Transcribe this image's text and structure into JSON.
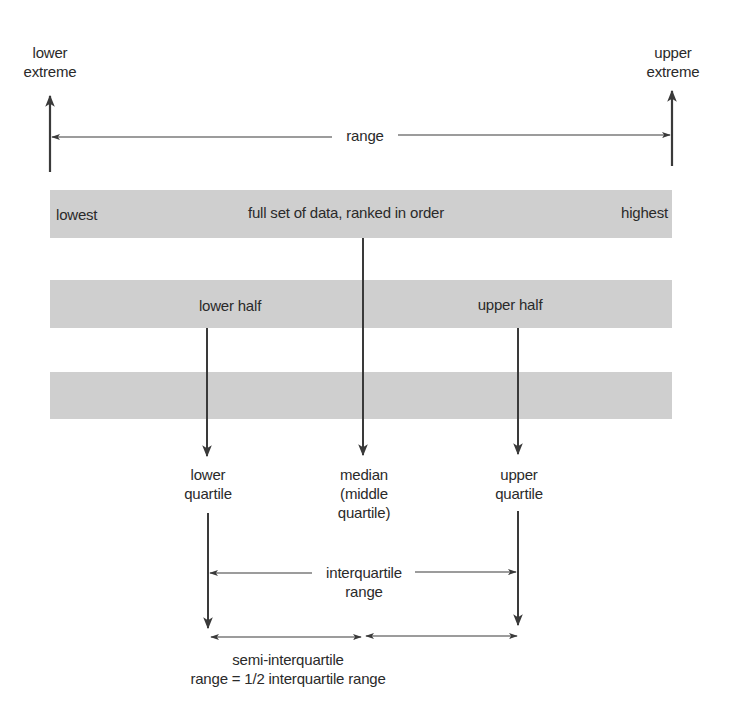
{
  "colors": {
    "band": "#cfcfcf",
    "line": "#3a3a3a",
    "text": "#2a2a2a",
    "background": "#ffffff"
  },
  "extremes": {
    "lower": {
      "line1": "lower",
      "line2": "extreme"
    },
    "upper": {
      "line1": "upper",
      "line2": "extreme"
    },
    "range_label": "range"
  },
  "bands": {
    "full_set": {
      "left_label": "lowest",
      "center_label": "full set of data, ranked in order",
      "right_label": "highest"
    },
    "halves": {
      "lower_label": "lower half",
      "upper_label": "upper half"
    },
    "third": {}
  },
  "quartiles": {
    "lower": {
      "line1": "lower",
      "line2": "quartile"
    },
    "median": {
      "line1": "median",
      "line2": "(middle",
      "line3": "quartile)"
    },
    "upper": {
      "line1": "upper",
      "line2": "quartile"
    }
  },
  "interquartile": {
    "line1": "interquartile",
    "line2": "range"
  },
  "semi_interquartile": {
    "line1": "semi-interquartile",
    "line2": "range = 1/2 interquartile range"
  }
}
